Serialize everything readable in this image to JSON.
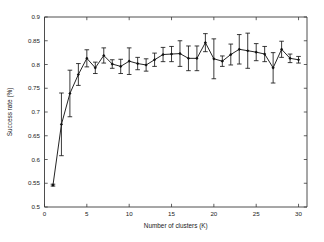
{
  "figure": {
    "background_color": "#ffffff",
    "line_color": "#181818",
    "axis_color": "#3a3a3a"
  },
  "chart_data": {
    "type": "line",
    "title": "",
    "xlabel": "Number of clusters (K)",
    "ylabel": "Success rate (%)",
    "xlim": [
      0,
      31
    ],
    "ylim": [
      0.5,
      0.9
    ],
    "xticks": [
      0,
      5,
      10,
      15,
      20,
      25,
      30
    ],
    "xticklabels": [
      "0",
      "5",
      "10",
      "15",
      "20",
      "25",
      "30"
    ],
    "yticks": [
      0.5,
      0.55,
      0.6,
      0.65,
      0.7,
      0.75,
      0.8,
      0.85,
      0.9
    ],
    "yticklabels": [
      "0.5",
      "0.55",
      "0.6",
      "0.65",
      "0.7",
      "0.75",
      "0.8",
      "0.85",
      "0.9"
    ],
    "grid": false,
    "legend": null,
    "marker": "diamond",
    "errorbars": true,
    "x": [
      1,
      2,
      3,
      4,
      5,
      6,
      7,
      8,
      9,
      10,
      11,
      12,
      13,
      14,
      15,
      16,
      17,
      18,
      19,
      20,
      21,
      22,
      23,
      24,
      25,
      26,
      27,
      28,
      29,
      30
    ],
    "values": [
      0.546,
      0.674,
      0.739,
      0.779,
      0.813,
      0.793,
      0.819,
      0.801,
      0.796,
      0.807,
      0.802,
      0.799,
      0.81,
      0.821,
      0.822,
      0.823,
      0.813,
      0.813,
      0.846,
      0.812,
      0.807,
      0.821,
      0.832,
      0.829,
      0.826,
      0.822,
      0.793,
      0.832,
      0.813,
      0.81
    ],
    "yerr": [
      0.002,
      0.066,
      0.049,
      0.023,
      0.018,
      0.012,
      0.016,
      0.009,
      0.015,
      0.028,
      0.013,
      0.013,
      0.014,
      0.015,
      0.016,
      0.027,
      0.026,
      0.026,
      0.019,
      0.042,
      0.011,
      0.022,
      0.031,
      0.037,
      0.018,
      0.016,
      0.032,
      0.017,
      0.009,
      0.007
    ]
  }
}
